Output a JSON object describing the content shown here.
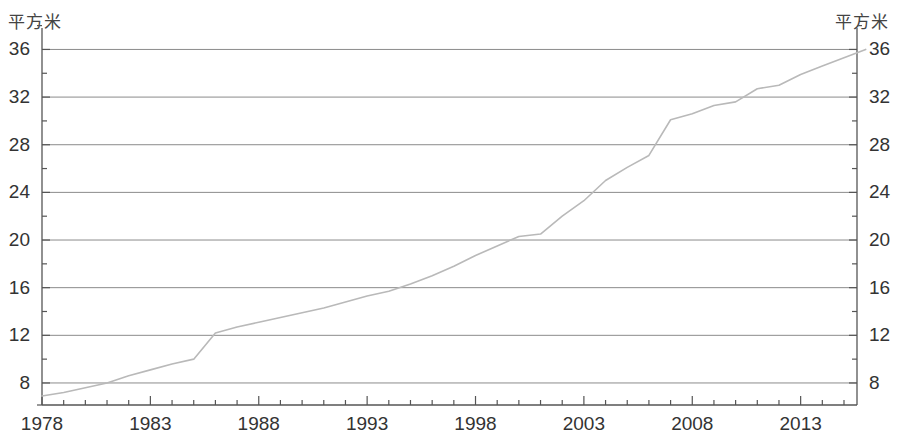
{
  "chart_data": {
    "type": "line",
    "title": "",
    "xlabel": "",
    "ylabel": "",
    "unit_label_left": "平方米",
    "unit_label_right": "平方米",
    "grid": true,
    "legend": null,
    "xlim": [
      1978,
      1978
    ],
    "ylim": [
      6,
      37.5
    ],
    "x_tick_labels": [
      "1978",
      "1983",
      "1988",
      "1993",
      "1998",
      "2003",
      "2008",
      "2013"
    ],
    "x_tick_values": [
      1978,
      1983,
      1988,
      1993,
      1998,
      2003,
      2008,
      2013
    ],
    "x_minor_step": 1,
    "y_tick_labels": [
      "8",
      "12",
      "16",
      "20",
      "24",
      "28",
      "32",
      "36"
    ],
    "y_tick_values": [
      8,
      12,
      16,
      20,
      24,
      28,
      32,
      36
    ],
    "y_minor_step": 2,
    "x": [
      1978,
      1979,
      1980,
      1981,
      1982,
      1983,
      1984,
      1985,
      1986,
      1987,
      1988,
      1989,
      1990,
      1991,
      1992,
      1993,
      1994,
      1995,
      1996,
      1997,
      1998,
      1999,
      2000,
      2001,
      2002,
      2003,
      2004,
      2005,
      2006,
      2007,
      2008,
      2009,
      2010,
      2011,
      2012,
      2013,
      2014,
      2015,
      2016
    ],
    "values": [
      6.9,
      7.2,
      7.6,
      8.0,
      8.6,
      9.1,
      9.6,
      10.0,
      12.2,
      12.7,
      13.1,
      13.5,
      13.9,
      14.3,
      14.8,
      15.3,
      15.7,
      16.3,
      17.0,
      17.8,
      18.7,
      19.5,
      20.3,
      20.5,
      22.0,
      23.3,
      25.0,
      26.1,
      27.1,
      30.1,
      30.6,
      31.3,
      31.6,
      32.7,
      33.0,
      33.9,
      34.6,
      35.3,
      36.0
    ],
    "series_name": "人均住房面积",
    "line_color": "#b9b9b9",
    "grid_color": "#8b8b8b",
    "axis_color": "#555555",
    "text_color": "#333333"
  },
  "geometry": {
    "plot_left": 42,
    "plot_right": 857,
    "plot_top": 28,
    "plot_bottom": 405,
    "y_value_top": 37.8,
    "y_value_bottom": 6.15,
    "x_value_left": 1978,
    "x_value_right": 2015.6
  }
}
